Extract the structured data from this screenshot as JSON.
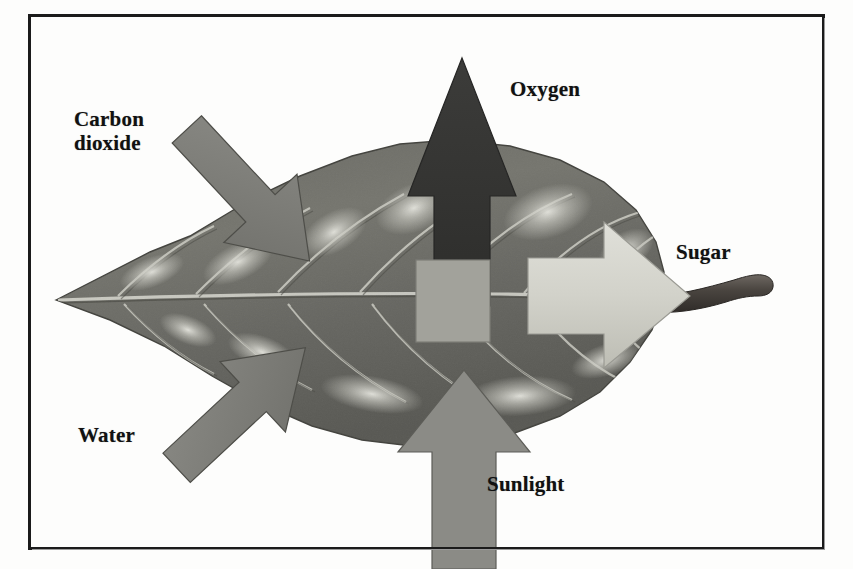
{
  "figure": {
    "style": "grayscale pencil illustration with labeled arrows",
    "border_color": "#1b1b1b",
    "background_color": "#fdfdfc"
  },
  "labels": {
    "carbon_dioxide": "Carbon\ndioxide",
    "oxygen": "Oxygen",
    "sugar": "Sugar",
    "water": "Water",
    "sunlight": "Sunlight"
  },
  "arrows": [
    {
      "name": "carbon-dioxide-arrow",
      "label": "Carbon dioxide",
      "direction": "down-right",
      "role": "input",
      "color": "#7c7c7c"
    },
    {
      "name": "water-arrow",
      "label": "Water",
      "direction": "up-right",
      "role": "input",
      "color": "#7a7a7a"
    },
    {
      "name": "sunlight-arrow",
      "label": "Sunlight",
      "direction": "up",
      "role": "input",
      "color": "#8a8a8a"
    },
    {
      "name": "oxygen-arrow",
      "label": "Oxygen",
      "direction": "up",
      "role": "output",
      "color": "#3b3b3b"
    },
    {
      "name": "sugar-arrow",
      "label": "Sugar",
      "direction": "right",
      "role": "output",
      "color": "#cfcfc8"
    }
  ],
  "leaf": {
    "name": "leaf",
    "body_color": "#6f6f6a",
    "vein_color": "#d9d9d2",
    "stem_color": "#5a5550",
    "center_box_color": "#a0a09a"
  },
  "colors": {
    "ink": "#111111",
    "paper": "#fdfdfc",
    "dark_arrow": "#3b3b3b",
    "mid_arrow": "#7c7c7c",
    "light_arrow": "#cfcfc8"
  }
}
